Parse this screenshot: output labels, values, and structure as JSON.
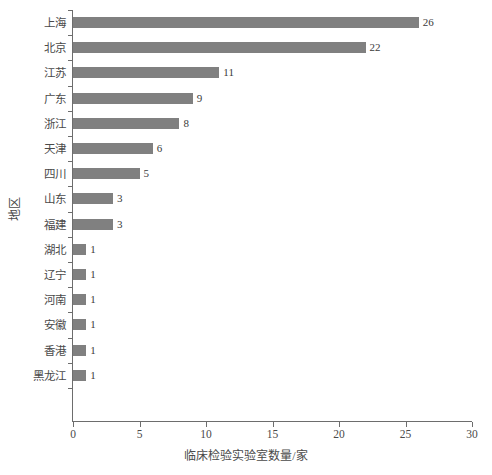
{
  "chart_data": {
    "type": "bar",
    "orientation": "horizontal",
    "title": "",
    "xlabel": "临床检验实验室数量/家",
    "ylabel": "地区",
    "categories": [
      "上海",
      "北京",
      "江苏",
      "广东",
      "浙江",
      "天津",
      "四川",
      "山东",
      "福建",
      "湖北",
      "辽宁",
      "河南",
      "安徽",
      "香港",
      "黑龙江"
    ],
    "values": [
      26,
      22,
      11,
      9,
      8,
      6,
      5,
      3,
      3,
      1,
      1,
      1,
      1,
      1,
      1
    ],
    "xlim": [
      0,
      30
    ],
    "xticks": [
      0,
      5,
      10,
      15,
      20,
      25,
      30
    ],
    "xtick_labels": [
      "0",
      "5",
      "10",
      "15",
      "20",
      "25",
      "30"
    ],
    "grid": false,
    "legend": null,
    "bar_color": "#808080",
    "axis_color": "#6d6d6d",
    "text_color": "#4a4a4a",
    "data_labels": [
      "26",
      "22",
      "11",
      "9",
      "8",
      "6",
      "5",
      "3",
      "3",
      "1",
      "1",
      "1",
      "1",
      "1",
      "1"
    ]
  },
  "caption": ""
}
